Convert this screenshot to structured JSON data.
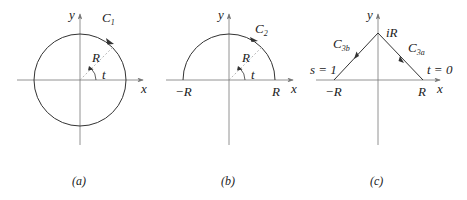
{
  "figure": {
    "panels": [
      {
        "id": "a",
        "caption": "(a)",
        "axis_x": "x",
        "axis_y": "y",
        "curve_label": "C",
        "curve_sub": "1",
        "radius_label": "R",
        "angle_label": "t"
      },
      {
        "id": "b",
        "caption": "(b)",
        "axis_x": "x",
        "axis_y": "y",
        "curve_label": "C",
        "curve_sub": "2",
        "radius_label": "R",
        "angle_label": "t",
        "left_tick": "−R",
        "right_tick": "R"
      },
      {
        "id": "c",
        "caption": "(c)",
        "axis_x": "x",
        "axis_y": "y",
        "apex_label": "iR",
        "left_curve_label": "C",
        "left_curve_sub": "3b",
        "right_curve_label": "C",
        "right_curve_sub": "3a",
        "left_param": "s = 1",
        "right_param": "t = 0",
        "left_tick": "−R",
        "right_tick": "R"
      }
    ]
  },
  "colors": {
    "stroke": "#333333",
    "axis": "#777777",
    "dashed": "#999999",
    "background": "#ffffff"
  }
}
